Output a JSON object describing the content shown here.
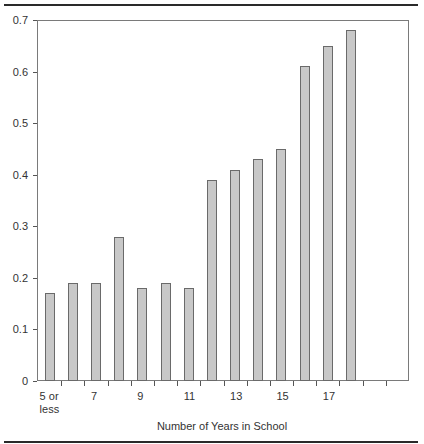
{
  "chart_data": {
    "type": "bar",
    "title": "",
    "xlabel": "Number of Years in School",
    "ylabel": "",
    "ylim": [
      0,
      0.7
    ],
    "yticks": [
      "0",
      "0.1",
      "0.2",
      "0.3",
      "0.4",
      "0.5",
      "0.6",
      "0.7"
    ],
    "xtick_labels": [
      {
        "slot": 0,
        "label": "5 or\nless"
      },
      {
        "slot": 2,
        "label": "7"
      },
      {
        "slot": 4,
        "label": "9"
      },
      {
        "slot": 6,
        "label": "11"
      },
      {
        "slot": 8,
        "label": "13"
      },
      {
        "slot": 10,
        "label": "15"
      },
      {
        "slot": 12,
        "label": "17"
      }
    ],
    "categories": [
      "5 or less",
      "6",
      "7",
      "8",
      "9",
      "10",
      "11",
      "12",
      "13",
      "14",
      "15",
      "16",
      "17",
      "18"
    ],
    "values": [
      0.17,
      0.19,
      0.19,
      0.28,
      0.18,
      0.19,
      0.18,
      0.39,
      0.41,
      0.43,
      0.45,
      0.61,
      0.65,
      0.68
    ],
    "empty_slots_after": 2,
    "grid": false,
    "legend": null,
    "bar_color": "#c8c8c8",
    "bar_edge_color": "#6a6a6a"
  }
}
